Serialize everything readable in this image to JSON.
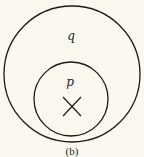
{
  "diagram": {
    "type": "venn-subset",
    "outer_set": {
      "label": "q",
      "color": "#1a1a1a"
    },
    "inner_set": {
      "label": "p",
      "color": "#1a1a1a"
    },
    "marker": {
      "symbol": "x-mark",
      "location": "inside p"
    },
    "caption": "(b)",
    "background": "#fbf9ef"
  }
}
